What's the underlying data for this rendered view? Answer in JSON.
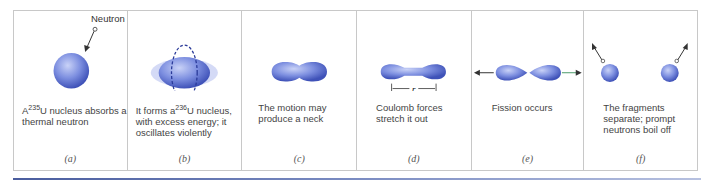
{
  "figure": {
    "panels": [
      {
        "id": "a",
        "label": "(a)",
        "caption_pre": "A",
        "caption_sup": "235",
        "caption_post": "U nucleus absorbs a thermal neutron",
        "annotation": "Neutron"
      },
      {
        "id": "b",
        "label": "(b)",
        "caption_pre": "It forms a",
        "caption_sup": "236",
        "caption_post": "U nucleus, with excess energy; it oscillates violently"
      },
      {
        "id": "c",
        "label": "(c)",
        "caption": "The motion may produce a neck"
      },
      {
        "id": "d",
        "label": "(d)",
        "caption": "Coulomb forces stretch it out",
        "annotation": "r"
      },
      {
        "id": "e",
        "label": "(e)",
        "caption": "Fission occurs"
      },
      {
        "id": "f",
        "label": "(f)",
        "caption": "The fragments separate; prompt neutrons boil off"
      }
    ],
    "colors": {
      "nucleus": "#5a6fd0",
      "nucleus_light": "#b8c4f2",
      "border": "#c8c8c8",
      "accent_bar": "#4a5d9e"
    }
  }
}
